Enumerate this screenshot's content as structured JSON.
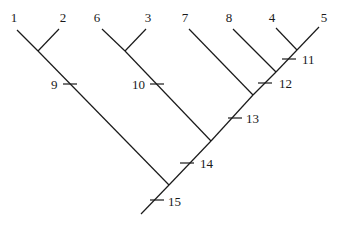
{
  "diagram": {
    "type": "cladogram",
    "leaves": [
      {
        "id": "1",
        "label": "1",
        "x": 17,
        "y": 30,
        "lx": 14,
        "ly": 22
      },
      {
        "id": "2",
        "label": "2",
        "x": 59,
        "y": 29,
        "lx": 63,
        "ly": 22
      },
      {
        "id": "6",
        "label": "6",
        "x": 102,
        "y": 29,
        "lx": 97,
        "ly": 22
      },
      {
        "id": "3",
        "label": "3",
        "x": 146,
        "y": 29,
        "lx": 148,
        "ly": 22
      },
      {
        "id": "7",
        "label": "7",
        "x": 189,
        "y": 29,
        "lx": 185,
        "ly": 22
      },
      {
        "id": "8",
        "label": "8",
        "x": 233,
        "y": 29,
        "lx": 229,
        "ly": 22
      },
      {
        "id": "4",
        "label": "4",
        "x": 276,
        "y": 28,
        "lx": 272,
        "ly": 22
      },
      {
        "id": "5",
        "label": "5",
        "x": 319,
        "y": 27,
        "lx": 324,
        "ly": 22
      }
    ],
    "internal_nodes": [
      {
        "id": "n12",
        "x": 38,
        "y": 51
      },
      {
        "id": "n63",
        "x": 125,
        "y": 51
      },
      {
        "id": "n45",
        "x": 297,
        "y": 50
      },
      {
        "id": "n845",
        "x": 276,
        "y": 72
      },
      {
        "id": "n7845",
        "x": 253,
        "y": 95
      },
      {
        "id": "n63_7845",
        "x": 211,
        "y": 141
      },
      {
        "id": "root_join",
        "x": 169,
        "y": 185
      },
      {
        "id": "root",
        "x": 141,
        "y": 214
      }
    ],
    "edges": [
      [
        "1",
        "n12"
      ],
      [
        "2",
        "n12"
      ],
      [
        "n12",
        "root_join"
      ],
      [
        "6",
        "n63"
      ],
      [
        "3",
        "n63"
      ],
      [
        "n63",
        "n63_7845"
      ],
      [
        "4",
        "n45"
      ],
      [
        "5",
        "n45"
      ],
      [
        "n45",
        "n845"
      ],
      [
        "8",
        "n845"
      ],
      [
        "n845",
        "n7845"
      ],
      [
        "7",
        "n7845"
      ],
      [
        "n7845",
        "n63_7845"
      ],
      [
        "n63_7845",
        "root_join"
      ],
      [
        "root_join",
        "root"
      ]
    ],
    "ticks": [
      {
        "label": "9",
        "x": 70,
        "y": 84,
        "side": "left",
        "lx": 51,
        "ly": 89
      },
      {
        "label": "10",
        "x": 157,
        "y": 84,
        "side": "left",
        "lx": 132,
        "ly": 89
      },
      {
        "label": "11",
        "x": 289,
        "y": 59,
        "side": "right",
        "lx": 302,
        "ly": 64
      },
      {
        "label": "12",
        "x": 265,
        "y": 83,
        "side": "right",
        "lx": 279,
        "ly": 88
      },
      {
        "label": "13",
        "x": 235,
        "y": 118,
        "side": "right",
        "lx": 246,
        "ly": 123
      },
      {
        "label": "14",
        "x": 187,
        "y": 163,
        "side": "right",
        "lx": 200,
        "ly": 168
      },
      {
        "label": "15",
        "x": 157,
        "y": 200,
        "side": "right",
        "lx": 168,
        "ly": 206
      }
    ]
  }
}
